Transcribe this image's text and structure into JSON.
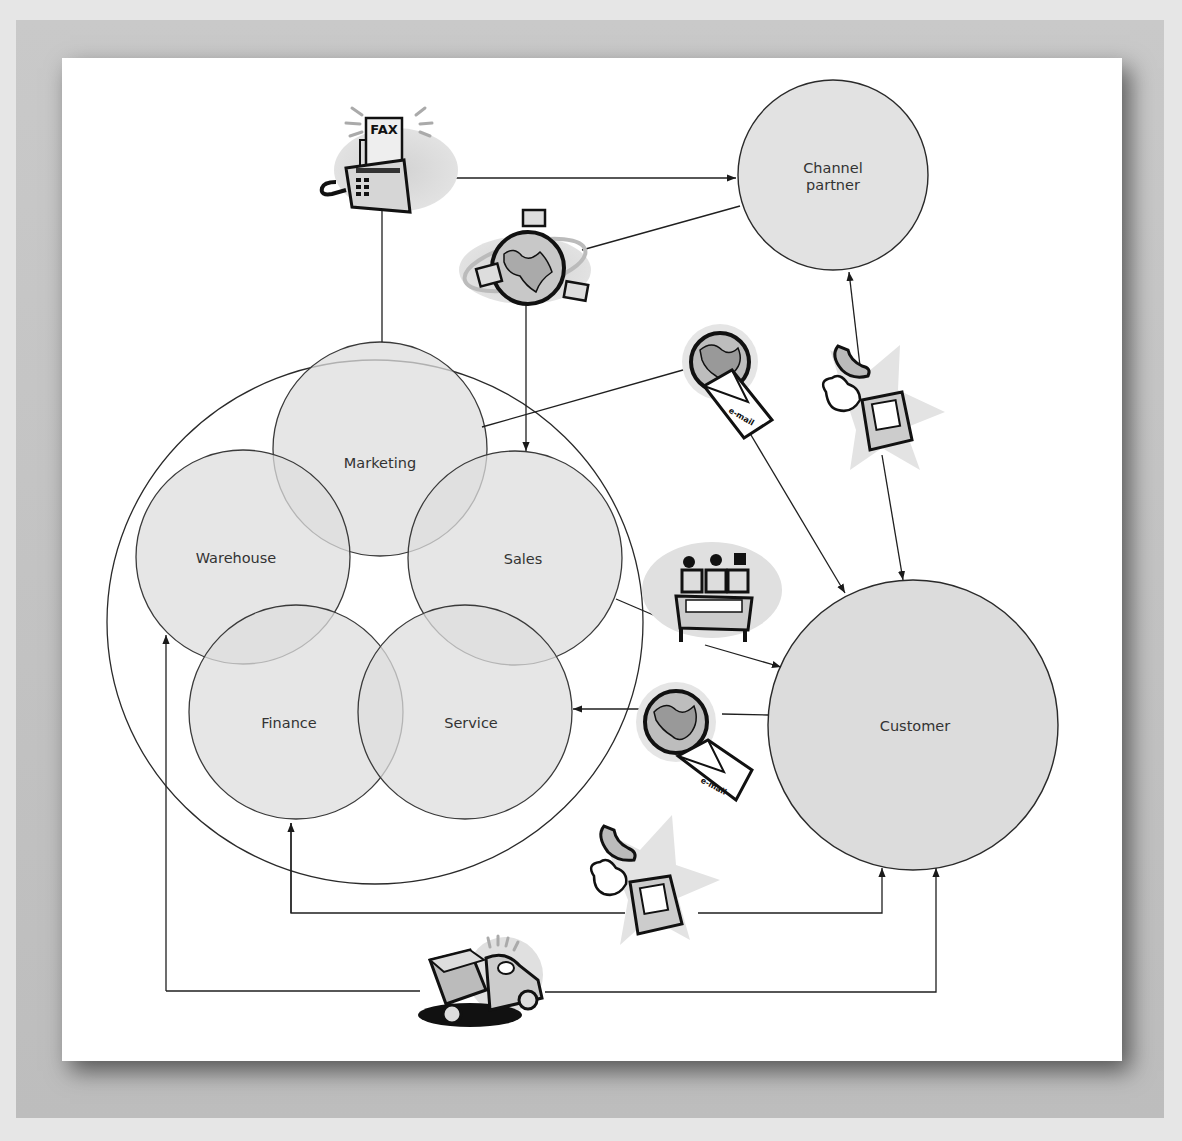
{
  "diagram": {
    "nodes": {
      "channel_partner": {
        "line1": "Channel",
        "line2": "partner"
      },
      "customer": {
        "label": "Customer"
      },
      "marketing": {
        "label": "Marketing"
      },
      "sales": {
        "label": "Sales"
      },
      "warehouse": {
        "label": "Warehouse"
      },
      "finance": {
        "label": "Finance"
      },
      "service": {
        "label": "Service"
      }
    },
    "icons": {
      "fax": {
        "label": "FAX",
        "name": "fax-machine-icon"
      },
      "web": {
        "name": "globe-network-icon"
      },
      "email_top": {
        "label": "e-mail",
        "name": "email-globe-icon"
      },
      "email_bottom": {
        "label": "e-mail",
        "name": "email-globe-icon"
      },
      "phone_right": {
        "name": "ringing-phone-icon"
      },
      "phone_bottom": {
        "name": "ringing-phone-icon"
      },
      "meeting": {
        "name": "sales-meeting-icon"
      },
      "truck": {
        "name": "delivery-truck-icon"
      }
    },
    "colors": {
      "circle_fill": "#e4e4e4",
      "overlap_fill": "#cfcfcf",
      "stroke": "#2a2a2a",
      "paper": "#ffffff",
      "frame": "#c4c4c4"
    }
  }
}
